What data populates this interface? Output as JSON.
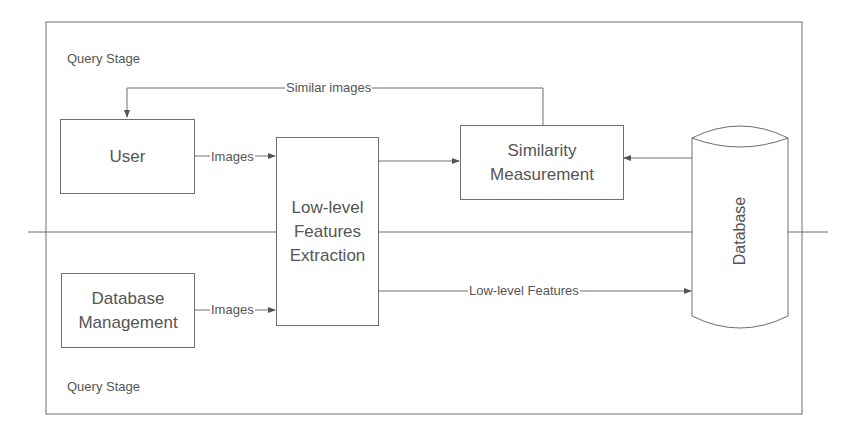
{
  "diagram": {
    "stages": {
      "top_label": "Query Stage",
      "bottom_label": "Query Stage"
    },
    "nodes": {
      "user": "User",
      "feature_extraction": "Low-level\nFeatures\nExtraction",
      "similarity": "Similarity\nMeasurement",
      "database": "Database",
      "db_management": "Database\nManagement"
    },
    "edges": {
      "user_to_extraction": "Images",
      "similarity_to_user": "Similar images",
      "dbm_to_extraction": "Images",
      "extraction_to_database": "Low-level Features"
    },
    "colors": {
      "line": "#6e6e6e",
      "text": "#555555",
      "background": "#ffffff"
    }
  }
}
